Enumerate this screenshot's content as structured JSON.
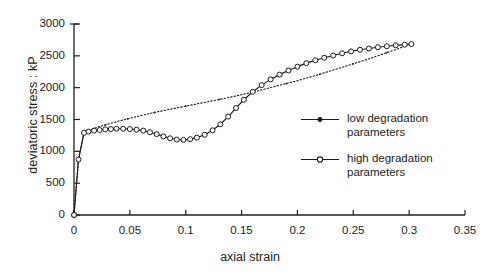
{
  "chart_data": {
    "type": "line",
    "title": "",
    "xlabel": "axial strain",
    "ylabel": "deviatoric stress : kP",
    "xlim": [
      0,
      0.35
    ],
    "ylim": [
      0,
      3000
    ],
    "xticks": [
      "0",
      "0.05",
      "0.1",
      "0.15",
      "0.2",
      "0.25",
      "0.3",
      "0.35"
    ],
    "xtick_values": [
      0,
      0.05,
      0.1,
      0.15,
      0.2,
      0.25,
      0.3,
      0.35
    ],
    "yticks": [
      "0",
      "500",
      "1000",
      "1500",
      "2000",
      "2500",
      "3000"
    ],
    "ytick_values": [
      0,
      500,
      1000,
      1500,
      2000,
      2500,
      3000
    ],
    "grid": false,
    "legend_position": "center-right",
    "series": [
      {
        "name": "low degradation parameters",
        "label_lines": "low degradation\nparameters",
        "marker": "dot",
        "linestyle": "dotted",
        "color": "#1a1a1a",
        "x": [
          0.0,
          0.004,
          0.009,
          0.013,
          0.018,
          0.023,
          0.028,
          0.033,
          0.04,
          0.048,
          0.056,
          0.064,
          0.072,
          0.08,
          0.09,
          0.1,
          0.11,
          0.12,
          0.13,
          0.14,
          0.15,
          0.16,
          0.17,
          0.18,
          0.19,
          0.2,
          0.21,
          0.22,
          0.23,
          0.24,
          0.25,
          0.26,
          0.27,
          0.28,
          0.29,
          0.3
        ],
        "y": [
          0,
          870,
          1300,
          1330,
          1360,
          1390,
          1415,
          1440,
          1475,
          1510,
          1545,
          1580,
          1610,
          1640,
          1675,
          1710,
          1745,
          1780,
          1815,
          1850,
          1890,
          1930,
          1975,
          2020,
          2065,
          2110,
          2160,
          2210,
          2265,
          2320,
          2375,
          2430,
          2490,
          2550,
          2610,
          2680
        ]
      },
      {
        "name": "high degradation parameters",
        "label_lines": "high degradation\nparameters",
        "marker": "open-circle",
        "linestyle": "solid",
        "color": "#1a1a1a",
        "x": [
          0.0,
          0.004,
          0.009,
          0.013,
          0.018,
          0.023,
          0.028,
          0.033,
          0.038,
          0.044,
          0.05,
          0.056,
          0.062,
          0.068,
          0.074,
          0.08,
          0.086,
          0.092,
          0.098,
          0.104,
          0.11,
          0.117,
          0.124,
          0.131,
          0.138,
          0.145,
          0.152,
          0.16,
          0.168,
          0.176,
          0.184,
          0.192,
          0.2,
          0.208,
          0.216,
          0.224,
          0.232,
          0.24,
          0.248,
          0.256,
          0.264,
          0.272,
          0.28,
          0.288,
          0.296,
          0.302
        ],
        "y": [
          0,
          870,
          1290,
          1310,
          1325,
          1335,
          1345,
          1350,
          1355,
          1355,
          1350,
          1340,
          1325,
          1300,
          1270,
          1235,
          1205,
          1185,
          1180,
          1190,
          1215,
          1260,
          1330,
          1425,
          1545,
          1680,
          1810,
          1935,
          2040,
          2130,
          2205,
          2270,
          2330,
          2385,
          2430,
          2470,
          2505,
          2540,
          2570,
          2595,
          2615,
          2635,
          2650,
          2665,
          2675,
          2685
        ]
      }
    ]
  }
}
